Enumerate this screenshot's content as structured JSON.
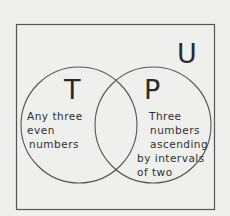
{
  "diagram": {
    "type": "venn",
    "universe": {
      "label": "U"
    },
    "sets": [
      {
        "label": "T",
        "description_lines": [
          "Any three",
          "even",
          "numbers"
        ]
      },
      {
        "label": "P",
        "description_lines": [
          "Three",
          "numbers",
          "ascending",
          "by intervals",
          "of two"
        ]
      }
    ],
    "colors": {
      "background": "#efefed",
      "stroke": "#555555",
      "text": "#2a2a2a"
    }
  }
}
